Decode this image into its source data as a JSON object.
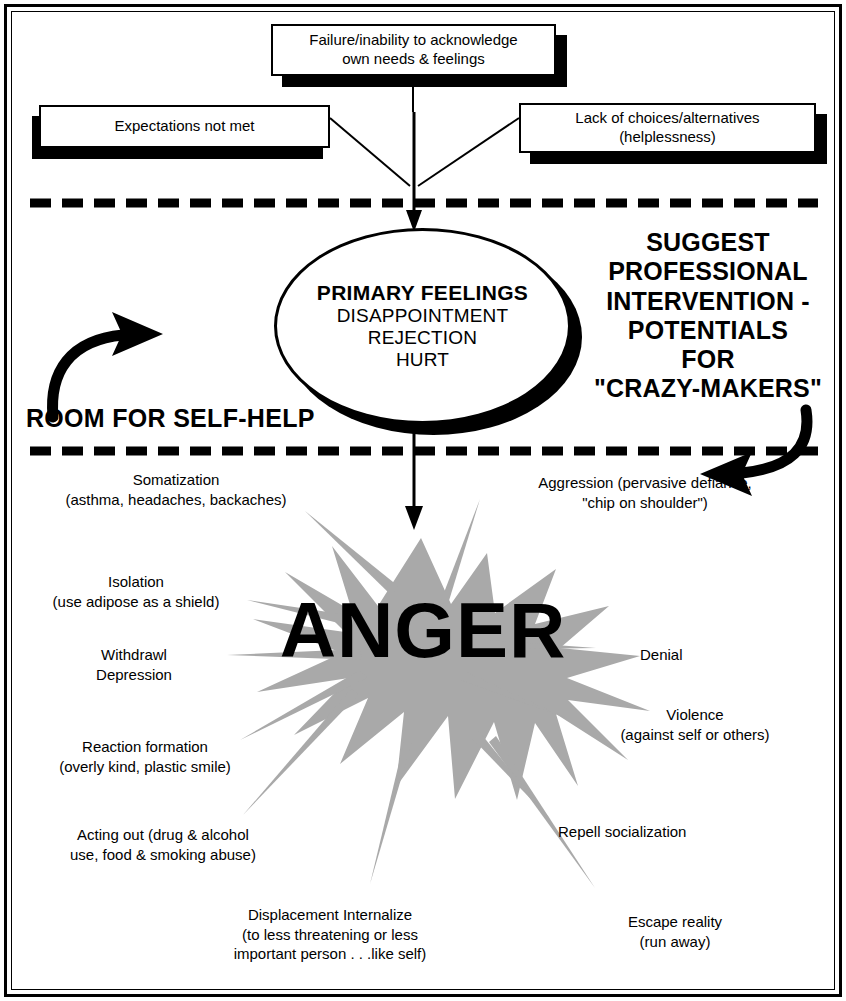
{
  "diagram": {
    "colors": {
      "ink": "#000000",
      "burst": "#a9a9a9",
      "page": "#ffffff"
    },
    "top_boxes": [
      {
        "name": "failure-box",
        "lines": [
          "Failure/inability to acknowledge",
          "own needs & feelings"
        ]
      },
      {
        "name": "expectations-box",
        "lines": [
          "Expectations not met"
        ]
      },
      {
        "name": "lack-of-choices-box",
        "lines": [
          "Lack of choices/alternatives",
          "(helplessness)"
        ]
      }
    ],
    "ellipse": {
      "line1": "PRIMARY FEELINGS",
      "line2": "DISAPPOINTMENT",
      "line3": "REJECTION",
      "line4": "HURT"
    },
    "zone_left_caption": "ROOM FOR SELF-HELP",
    "zone_right_caption": [
      "SUGGEST",
      "PROFESSIONAL",
      "INTERVENTION -",
      "POTENTIALS",
      "FOR",
      "\"CRAZY-MAKERS\""
    ],
    "burst_label": "ANGER",
    "outcomes_left": [
      {
        "name": "somatization",
        "lines": [
          "Somatization",
          "(asthma, headaches, backaches)"
        ]
      },
      {
        "name": "isolation",
        "lines": [
          "Isolation",
          "(use adipose as a shield)"
        ]
      },
      {
        "name": "withdrawl-depression",
        "lines": [
          "Withdrawl",
          "Depression"
        ]
      },
      {
        "name": "reaction-formation",
        "lines": [
          "Reaction formation",
          "(overly kind, plastic smile)"
        ]
      },
      {
        "name": "acting-out",
        "lines": [
          "Acting out (drug & alcohol",
          "use, food & smoking abuse)"
        ]
      }
    ],
    "outcomes_bottom": [
      {
        "name": "displacement-internalize",
        "lines": [
          "Displacement Internalize",
          "(to less threatening or less",
          "important person . . .like self)"
        ]
      }
    ],
    "outcomes_right": [
      {
        "name": "aggression",
        "lines": [
          "Aggression (pervasive defiance,",
          "\"chip on shoulder\")"
        ]
      },
      {
        "name": "denial",
        "lines": [
          "Denial"
        ]
      },
      {
        "name": "violence",
        "lines": [
          "Violence",
          "(against self or others)"
        ]
      },
      {
        "name": "repell-socialization",
        "lines": [
          "Repell socialization"
        ]
      },
      {
        "name": "escape-reality",
        "lines": [
          "Escape reality",
          "(run away)"
        ]
      }
    ]
  }
}
